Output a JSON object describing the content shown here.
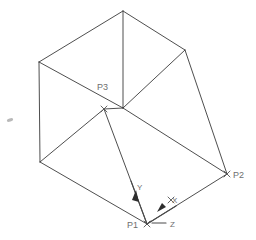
{
  "drawing": {
    "title": "Isometric wireframe box with UCS axes",
    "background_color": "#ffffff",
    "line_color": "#3a3a3a",
    "label_color": "#6e6e6e",
    "axis_color": "#4a4a4a",
    "width": 256,
    "height": 240
  },
  "points": [
    {
      "id": "p3",
      "label": "P3",
      "marker": "x-mark",
      "x": 104,
      "y": 109,
      "label_x": 97,
      "label_y": 90
    },
    {
      "id": "p2",
      "label": "P2",
      "marker": "x-mark",
      "x": 227,
      "y": 174,
      "label_x": 233,
      "label_y": 178
    },
    {
      "id": "p1",
      "label": "P1",
      "marker": "x-mark",
      "x": 147,
      "y": 224,
      "label_x": 127,
      "label_y": 228
    }
  ],
  "axes": [
    {
      "id": "y",
      "label": "Y",
      "label_x": 137,
      "label_y": 190,
      "direction": "down-left"
    },
    {
      "id": "x",
      "label": "X",
      "label_x": 172,
      "label_y": 203,
      "direction": "down-left"
    },
    {
      "id": "z",
      "label": "Z",
      "label_x": 170,
      "label_y": 227,
      "direction": "right"
    }
  ],
  "geometry": {
    "vertices": {
      "apex_top": [
        123,
        11
      ],
      "left_top": [
        39,
        62
      ],
      "right_top": [
        185,
        50
      ],
      "left_bottom": [
        40,
        162
      ],
      "center_mid": [
        123,
        108
      ],
      "p3": [
        104,
        109
      ],
      "p2": [
        227,
        174
      ],
      "p1": [
        147,
        224
      ]
    },
    "edge_count": 12
  },
  "artifact": {
    "name": "speck",
    "x": 10,
    "y": 120
  }
}
